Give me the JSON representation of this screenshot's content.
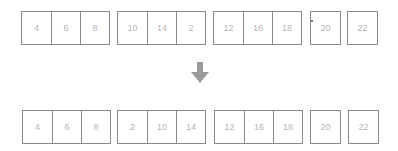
{
  "before": {
    "groups": [
      {
        "cells": [
          "4",
          "6",
          "8"
        ]
      },
      {
        "cells": [
          "10",
          "14",
          "2"
        ]
      },
      {
        "cells": [
          "12",
          "16",
          "18"
        ]
      },
      {
        "cells": [
          "20"
        ]
      },
      {
        "cells": [
          "22"
        ]
      }
    ]
  },
  "after": {
    "groups": [
      {
        "cells": [
          "4",
          "6",
          "8"
        ]
      },
      {
        "cells": [
          "2",
          "10",
          "14"
        ]
      },
      {
        "cells": [
          "12",
          "16",
          "18"
        ]
      },
      {
        "cells": [
          "20"
        ]
      },
      {
        "cells": [
          "22"
        ]
      }
    ]
  },
  "arrow": {
    "icon": "arrow-down-icon",
    "color": "#9a9a9a"
  },
  "colors": {
    "border": "#8a8a8a",
    "text": "#b5b5b5"
  }
}
